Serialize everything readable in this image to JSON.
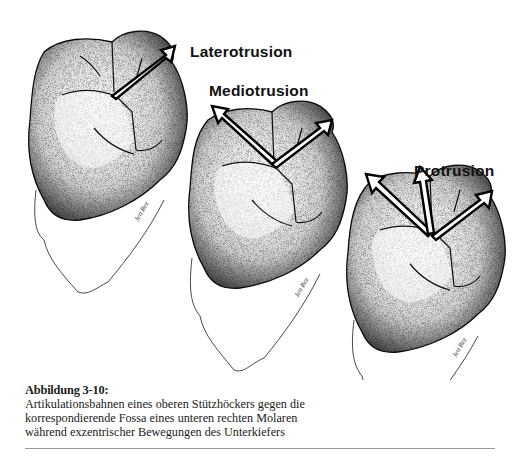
{
  "figure": {
    "teeth": [
      {
        "id": "tooth-1",
        "movement_label": "Laterotrusion",
        "arrows": [
          "laterotrusion"
        ]
      },
      {
        "id": "tooth-2",
        "movement_label": "Mediotrusion",
        "arrows": [
          "mediotrusion",
          "laterotrusion"
        ]
      },
      {
        "id": "tooth-3",
        "movement_label": "Protrusion",
        "arrows": [
          "mediotrusion",
          "protrusion",
          "laterotrusion"
        ]
      }
    ],
    "labels": {
      "laterotrusion": "Laterotrusion",
      "mediotrusion": "Mediotrusion",
      "protrusion": "Protrusion"
    }
  },
  "caption": {
    "title": "Abbildung 3-10:",
    "lines": [
      "Artikulationsbahnen eines oberen Stützhöckers gegen die",
      "korrespondierende Fossa eines unteren rechten Molaren",
      "während exzentrischer Bewegungen des Unterkiefers"
    ]
  }
}
